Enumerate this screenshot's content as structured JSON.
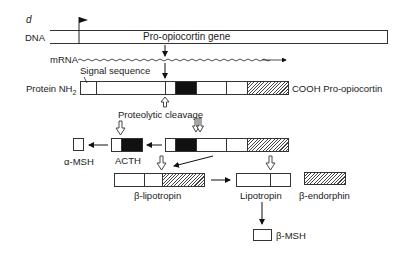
{
  "panel_label": "d",
  "rows": {
    "dna": {
      "label": "DNA",
      "gene_label": "Pro-opiocortin gene"
    },
    "mrna": {
      "label": "mRNA"
    },
    "protein": {
      "label_prefix": "Protein NH",
      "label_sub": "2",
      "signal_label": "Signal sequence",
      "suffix_label": "COOH Pro-opiocortin"
    }
  },
  "annotations": {
    "cleavage": "Proteolytic cleavage"
  },
  "products": {
    "alpha_msh": "α-MSH",
    "acth": "ACTH",
    "beta_lipotropin": "β-lipotropin",
    "lipotropin": "Lipotropin",
    "beta_endorphin": "β-endorphin",
    "beta_msh": "β-MSH"
  }
}
